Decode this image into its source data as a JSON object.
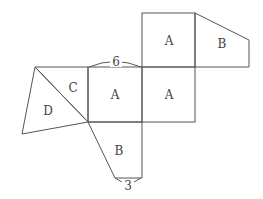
{
  "diagram": {
    "type": "net-of-solid",
    "faces": [
      {
        "id": "top-square",
        "label": "A",
        "shape": "square"
      },
      {
        "id": "top-right-trapezoid",
        "label": "B",
        "shape": "trapezoid"
      },
      {
        "id": "middle-left-square",
        "label": "A",
        "shape": "square"
      },
      {
        "id": "middle-right-square",
        "label": "A",
        "shape": "square"
      },
      {
        "id": "triangle-c",
        "label": "C",
        "shape": "triangle"
      },
      {
        "id": "triangle-d",
        "label": "D",
        "shape": "triangle"
      },
      {
        "id": "bottom-trapezoid",
        "label": "B",
        "shape": "trapezoid"
      }
    ],
    "dimensions": [
      {
        "id": "square-side",
        "value": "6"
      },
      {
        "id": "trapezoid-short-side",
        "value": "3"
      }
    ],
    "colors": {
      "line": "#555555",
      "text": "#444444",
      "background": "#ffffff"
    }
  }
}
